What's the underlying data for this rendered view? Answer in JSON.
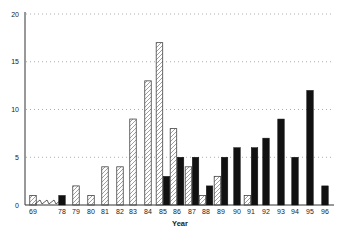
{
  "chart_data": {
    "type": "bar",
    "title": "",
    "xlabel": "Year",
    "ylabel": "",
    "ylim": [
      0,
      20
    ],
    "yticks": [
      0,
      5,
      10,
      15,
      20
    ],
    "grid": "horizontal dotted",
    "axis_break": "between 69 and 78 (zigzag)",
    "categories": [
      "69",
      "78",
      "79",
      "80",
      "81",
      "82",
      "83",
      "84",
      "85",
      "86",
      "87",
      "88",
      "89",
      "90",
      "91",
      "92",
      "93",
      "94",
      "95",
      "96"
    ],
    "series": [
      {
        "name": "hatched",
        "pattern": "diagonal-hatch",
        "values": [
          1,
          0,
          2,
          1,
          4,
          4,
          9,
          13,
          17,
          8,
          4,
          1,
          3,
          0,
          1,
          0,
          0,
          0,
          0,
          0
        ]
      },
      {
        "name": "solid",
        "pattern": "solid-black",
        "values": [
          0,
          1,
          0,
          0,
          0,
          0,
          0,
          0,
          3,
          5,
          5,
          2,
          5,
          6,
          6,
          7,
          9,
          5,
          12,
          2
        ]
      }
    ]
  },
  "layout": {
    "x_centers": [
      33,
      62,
      76,
      91,
      105,
      120,
      133,
      148,
      163,
      177,
      192,
      206,
      221,
      237,
      251,
      266,
      281,
      295,
      310,
      325
    ]
  }
}
